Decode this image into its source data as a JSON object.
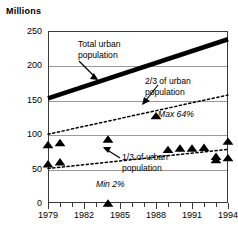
{
  "chart_data": {
    "type": "line",
    "title": "",
    "ylabel": "Millions",
    "xlabel": "",
    "ylim": [
      0,
      250
    ],
    "xlim": [
      1979,
      1994
    ],
    "grid": true,
    "legend": "none",
    "ytick_labels": [
      "0",
      "50",
      "100",
      "150",
      "200",
      "250"
    ],
    "ytick_values": [
      0,
      50,
      100,
      150,
      200,
      250
    ],
    "xtick_labels": [
      "1979",
      "1982",
      "1985",
      "1988",
      "1991",
      "1994"
    ],
    "xtick_values": [
      1979,
      1982,
      1985,
      1988,
      1991,
      1994
    ],
    "series": [
      {
        "name": "Total urban population",
        "style": "thick-solid",
        "x": [
          1979,
          1994
        ],
        "values": [
          152,
          238
        ]
      },
      {
        "name": "2/3 of urban population",
        "style": "dashed",
        "x": [
          1979,
          1994
        ],
        "values": [
          100,
          157
        ]
      },
      {
        "name": "1/3 of urban population",
        "style": "dashed",
        "x": [
          1979,
          1994
        ],
        "values": [
          50,
          78
        ]
      },
      {
        "name": "Upper observations",
        "style": "triangle-markers",
        "points": [
          {
            "x": 1979,
            "y": 85
          },
          {
            "x": 1980,
            "y": 88
          },
          {
            "x": 1984,
            "y": 93
          },
          {
            "x": 1988,
            "y": 127
          },
          {
            "x": 1989,
            "y": 78
          },
          {
            "x": 1990,
            "y": 80
          },
          {
            "x": 1991,
            "y": 80
          },
          {
            "x": 1992,
            "y": 81
          },
          {
            "x": 1993,
            "y": 68
          },
          {
            "x": 1994,
            "y": 90
          }
        ]
      },
      {
        "name": "Lower observations",
        "style": "triangle-markers",
        "points": [
          {
            "x": 1979,
            "y": 57
          },
          {
            "x": 1980,
            "y": 60
          },
          {
            "x": 1984,
            "y": 0
          },
          {
            "x": 1993,
            "y": 63
          },
          {
            "x": 1994,
            "y": 66
          }
        ]
      }
    ],
    "annotations": [
      {
        "name": "total-urban-population",
        "text": "Total urban\npopulation",
        "italic": false
      },
      {
        "name": "two-thirds-urban-population",
        "text": "2/3 of urban\npopulation",
        "italic": false
      },
      {
        "name": "one-third-urban-population",
        "text": "1/3 of urban\npopulation",
        "italic": false
      },
      {
        "name": "max-64-percent",
        "text": "Max 64%",
        "italic": true
      },
      {
        "name": "min-2-percent",
        "text": "Min 2%",
        "italic": true
      }
    ]
  },
  "labels": {
    "millions": "Millions",
    "y0": "0",
    "y50": "50",
    "y100": "100",
    "y150": "150",
    "y200": "200",
    "y250": "250",
    "x1979": "1979",
    "x1982": "1982",
    "x1985": "1985",
    "x1988": "1988",
    "x1991": "1991",
    "x1994": "1994",
    "total_line1": "Total urban",
    "total_line2": "population",
    "twothirds_line1": "2/3 of urban",
    "twothirds_line2": "population",
    "onethird_line1": "1/3 of urban",
    "onethird_line2": "population",
    "max64": "Max 64%",
    "min2": "Min 2%"
  },
  "colors": {
    "ink": "#000000",
    "frame": "#3a3a3a",
    "grid": "#9a9a9a",
    "background": "#ffffff"
  }
}
